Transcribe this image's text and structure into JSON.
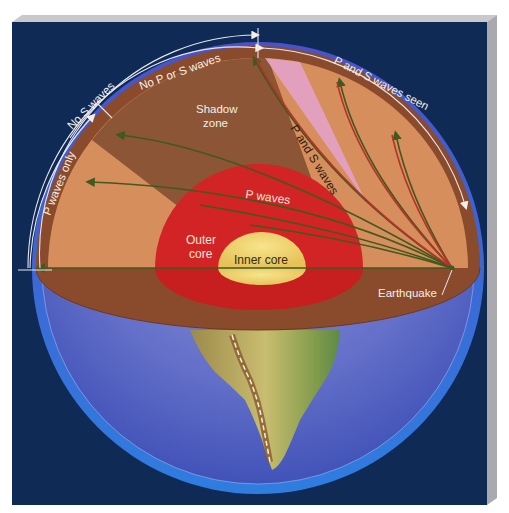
{
  "figure": {
    "type": "cross-section diagram"
  },
  "arc_labels": {
    "p_and_s_waves_seen": "P and S waves seen",
    "no_p_or_s_waves": "No P or S waves",
    "no_s_waves": "No S waves",
    "p_waves_only": "P waves only"
  },
  "interior_labels": {
    "shadow_zone_line1": "Shadow",
    "shadow_zone_line2": "zone",
    "p_and_s_waves": "P and S waves",
    "p_waves": "P waves",
    "outer_core_line1": "Outer",
    "outer_core_line2": "core",
    "inner_core": "Inner core",
    "earthquake": "Earthquake"
  },
  "colors": {
    "background_panel": "#0f2a55",
    "panel_bevel": "#b9b9bd",
    "atmosphere_rim": "#3f6fd6",
    "ocean": "#5a6cc6",
    "crust": "#8a4a2c",
    "mantle_shadow": "#8b5536",
    "mantle_lit": "#d9915c",
    "pink_wedge": "#e3a0c6",
    "outer_core": "#d42424",
    "inner_core": "#f0d470",
    "wave_path_green": "#3f5a1e",
    "wave_path_red": "#b8322a",
    "continent": "#b9a85a",
    "label_light": "#f4efe6"
  }
}
